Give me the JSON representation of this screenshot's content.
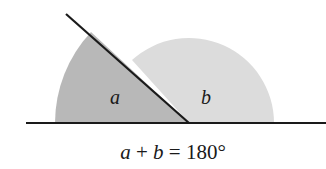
{
  "figure": {
    "angle_labels": {
      "a": "a",
      "b": "b"
    },
    "equation": {
      "var_a": "a",
      "plus": " + ",
      "var_b": "b",
      "equals_value": " = 180°"
    },
    "colors": {
      "angle_a_fill": "#b8b8b8",
      "angle_b_fill": "#dcdcdc",
      "lines": "#1a1a1a",
      "background": "#ffffff"
    }
  }
}
